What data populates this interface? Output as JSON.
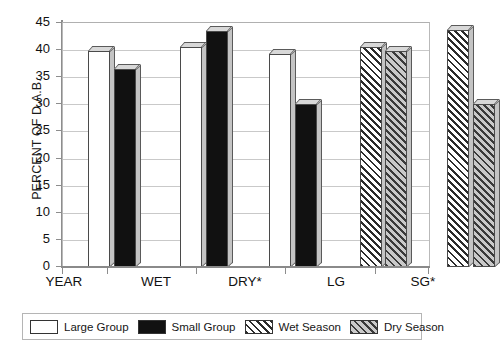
{
  "chart_data": {
    "type": "bar",
    "title": "",
    "xlabel": "",
    "ylabel": "PERCENT OF D.A.B.",
    "ylim": [
      0,
      45
    ],
    "ytick_values": [
      45,
      40,
      35,
      30,
      25,
      20,
      15,
      10,
      5,
      0
    ],
    "ytick_labels": [
      "45",
      "40",
      "35",
      "30",
      "25",
      "20",
      "15",
      "10",
      "5",
      "0"
    ],
    "grid": true,
    "legend_position": "bottom",
    "categories": [
      "YEAR",
      "WET",
      "DRY*",
      "LG",
      "SG*"
    ],
    "series": [
      {
        "name": "Large Group",
        "style": "white",
        "values": [
          39.8,
          40.5,
          39.3,
          null,
          null
        ]
      },
      {
        "name": "Small Group",
        "style": "black",
        "values": [
          36.5,
          43.5,
          30.0,
          null,
          null
        ]
      },
      {
        "name": "Wet Season",
        "style": "hatch-white",
        "values": [
          null,
          null,
          null,
          40.6,
          43.8
        ]
      },
      {
        "name": "Dry Season",
        "style": "hatch-gray",
        "values": [
          null,
          null,
          null,
          39.8,
          30.0
        ]
      }
    ],
    "bars": [
      {
        "category": "YEAR",
        "series": "Large Group",
        "value": 39.8,
        "style": "white"
      },
      {
        "category": "YEAR",
        "series": "Small Group",
        "value": 36.5,
        "style": "black"
      },
      {
        "category": "WET",
        "series": "Large Group",
        "value": 40.5,
        "style": "white"
      },
      {
        "category": "WET",
        "series": "Small Group",
        "value": 43.5,
        "style": "black"
      },
      {
        "category": "DRY*",
        "series": "Large Group",
        "value": 39.3,
        "style": "white"
      },
      {
        "category": "DRY*",
        "series": "Small Group",
        "value": 30.0,
        "style": "black"
      },
      {
        "category": "LG",
        "series": "Wet Season",
        "value": 40.6,
        "style": "hatch-white"
      },
      {
        "category": "LG",
        "series": "Dry Season",
        "value": 39.8,
        "style": "hatch-gray"
      },
      {
        "category": "SG*",
        "series": "Wet Season",
        "value": 43.8,
        "style": "hatch-white"
      },
      {
        "category": "SG*",
        "series": "Dry Season",
        "value": 30.0,
        "style": "hatch-gray"
      }
    ],
    "legend": [
      {
        "label": "Large Group",
        "style": "white"
      },
      {
        "label": "Small Group",
        "style": "black"
      },
      {
        "label": "Wet Season",
        "style": "hatch-white"
      },
      {
        "label": "Dry Season",
        "style": "hatch-gray"
      }
    ],
    "colors": {
      "large_group": "#ffffff",
      "small_group": "#111111",
      "wet_season": "#ffffff",
      "dry_season": "#b6b6b6",
      "hatch": "#2b2b2b",
      "axis": "#8d8d8d",
      "grid": "#c9c9c9",
      "text": "#111111"
    }
  }
}
